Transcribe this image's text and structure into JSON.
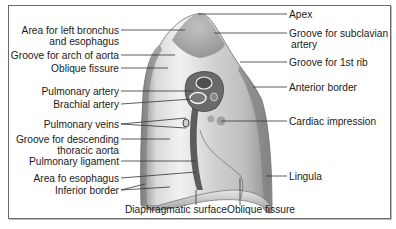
{
  "figure": {
    "labels_left": [
      {
        "id": "area-left-bronchus",
        "line1": "Area for left bronchus",
        "line2": "and esophagus"
      },
      {
        "id": "groove-arch-aorta",
        "line1": "Groove for arch of aorta"
      },
      {
        "id": "oblique-fissure-upper",
        "line1": "Oblique fissure"
      },
      {
        "id": "pulmonary-artery",
        "line1": "Pulmonary artery"
      },
      {
        "id": "brachial-artery",
        "line1": "Brachial artery"
      },
      {
        "id": "pulmonary-veins",
        "line1": "Pulmonary veins"
      },
      {
        "id": "groove-descending-aorta",
        "line1": "Groove for descending",
        "line2": "thoracic aorta"
      },
      {
        "id": "pulmonary-ligament",
        "line1": "Pulmonary ligament"
      },
      {
        "id": "area-esophagus",
        "line1": "Area fo esophagus"
      },
      {
        "id": "inferior-border",
        "line1": "Inferior border"
      }
    ],
    "labels_right": [
      {
        "id": "apex",
        "line1": "Apex"
      },
      {
        "id": "groove-subclavian",
        "line1": "Groove for subclavian",
        "line2": "artery"
      },
      {
        "id": "groove-1st-rib",
        "line1": "Groove for 1st rib"
      },
      {
        "id": "anterior-border",
        "line1": "Anterior border"
      },
      {
        "id": "cardiac-impression",
        "line1": "Cardiac impression"
      },
      {
        "id": "lingula",
        "line1": "Lingula"
      }
    ],
    "labels_bottom": [
      {
        "id": "diaphragmatic-surface",
        "line1": "Diaphragmatic surface"
      },
      {
        "id": "oblique-fissure-lower",
        "line1": "Oblique fissure"
      }
    ],
    "colors": {
      "frame": "#6a6a6a",
      "lung_light": "#e6e6e6",
      "lung_mid": "#b8b8b8",
      "lung_dark": "#7a7a7a",
      "leader": "#333333",
      "text": "#1a1a1a"
    }
  }
}
